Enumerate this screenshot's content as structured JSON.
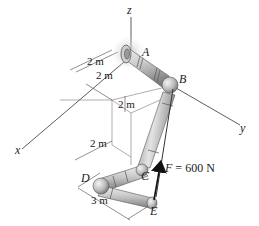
{
  "figure": {
    "type": "engineering-statics-diagram"
  },
  "axes": {
    "x": "x",
    "y": "y",
    "z": "z"
  },
  "points": {
    "A": "A",
    "B": "B",
    "C": "C",
    "D": "D",
    "E": "E"
  },
  "dimensions": {
    "d1": "2 m",
    "d2": "2 m",
    "d3": "2 m",
    "d4": "2 m",
    "d5": "3 m"
  },
  "force": {
    "label": "F = 600 N",
    "symbol": "F",
    "magnitude": "600 N"
  },
  "colors": {
    "pipe_light": "#d9d9d9",
    "pipe_mid": "#a8a8a8",
    "pipe_dark": "#6e6e6e",
    "flange_glow": "#c8c8c8",
    "line": "#333333",
    "force_arrow": "#111111"
  }
}
